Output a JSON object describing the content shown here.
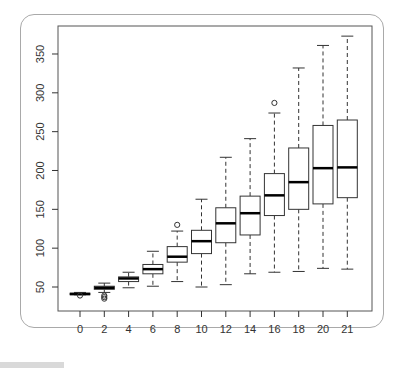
{
  "chart_data": {
    "type": "boxplot",
    "title": "",
    "xlabel": "",
    "ylabel": "",
    "categories": [
      "0",
      "2",
      "4",
      "6",
      "8",
      "10",
      "12",
      "14",
      "16",
      "18",
      "20",
      "21"
    ],
    "ylim": [
      30,
      380
    ],
    "yticks": [
      50,
      100,
      150,
      200,
      250,
      300,
      350
    ],
    "grid": false,
    "legend": null,
    "series": [
      {
        "name": "weight",
        "boxes": [
          {
            "x": "0",
            "min": 40,
            "q1": 41,
            "median": 41,
            "q3": 42,
            "max": 43,
            "outliers": [
              39
            ]
          },
          {
            "x": "2",
            "min": 43,
            "q1": 47,
            "median": 49,
            "q3": 51,
            "max": 55,
            "outliers": [
              39,
              37,
              35
            ]
          },
          {
            "x": "4",
            "min": 49,
            "q1": 57,
            "median": 61,
            "q3": 63,
            "max": 69,
            "outliers": []
          },
          {
            "x": "6",
            "min": 51,
            "q1": 67,
            "median": 73,
            "q3": 79,
            "max": 96,
            "outliers": []
          },
          {
            "x": "8",
            "min": 57,
            "q1": 82,
            "median": 89,
            "q3": 102,
            "max": 122,
            "outliers": [
              130
            ]
          },
          {
            "x": "10",
            "min": 50,
            "q1": 93,
            "median": 109,
            "q3": 123,
            "max": 163,
            "outliers": []
          },
          {
            "x": "12",
            "min": 53,
            "q1": 107,
            "median": 132,
            "q3": 152,
            "max": 217,
            "outliers": []
          },
          {
            "x": "14",
            "min": 67,
            "q1": 117,
            "median": 145,
            "q3": 167,
            "max": 241,
            "outliers": []
          },
          {
            "x": "16",
            "min": 69,
            "q1": 142,
            "median": 168,
            "q3": 196,
            "max": 274,
            "outliers": [
              287
            ]
          },
          {
            "x": "18",
            "min": 70,
            "q1": 150,
            "median": 185,
            "q3": 229,
            "max": 332,
            "outliers": []
          },
          {
            "x": "20",
            "min": 74,
            "q1": 157,
            "median": 203,
            "q3": 258,
            "max": 361,
            "outliers": []
          },
          {
            "x": "21",
            "min": 73,
            "q1": 165,
            "median": 204,
            "q3": 265,
            "max": 373,
            "outliers": []
          }
        ]
      }
    ]
  },
  "style": {
    "box_stroke": "#333333",
    "median_stroke": "#000000",
    "axis_color": "#333333",
    "frame_color": "#a9a9a9"
  }
}
